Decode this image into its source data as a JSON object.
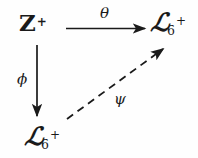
{
  "diagram": {
    "type": "commutative-diagram",
    "shape": "triangle",
    "background_color": "#fefefe",
    "ink_color": "#1a1a1a",
    "nodes": [
      {
        "id": "top-left",
        "base": "Z",
        "subscript": "",
        "superscript": "+",
        "style": "bold-upright",
        "text": "Z+"
      },
      {
        "id": "top-right",
        "base": "ℒ",
        "subscript": "6",
        "superscript": "+",
        "style": "script",
        "text": "Z6+"
      },
      {
        "id": "bottom-left",
        "base": "ℒ",
        "subscript": "6",
        "superscript": "+",
        "style": "script",
        "text": "Z6+"
      }
    ],
    "arrows": [
      {
        "id": "theta-arrow",
        "from": "top-left",
        "to": "top-right",
        "label": "θ",
        "label_name": "theta",
        "style": "solid",
        "direction": "horizontal-right"
      },
      {
        "id": "phi-arrow",
        "from": "top-left",
        "to": "bottom-left",
        "label": "ϕ",
        "label_name": "phi",
        "style": "solid",
        "direction": "vertical-down"
      },
      {
        "id": "psi-arrow",
        "from": "bottom-left",
        "to": "top-right",
        "label": "ψ",
        "label_name": "psi",
        "style": "dashed",
        "direction": "diagonal-up-right"
      }
    ]
  }
}
